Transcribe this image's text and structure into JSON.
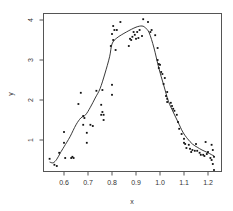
{
  "chart_data": {
    "type": "scatter",
    "title": "",
    "xlabel": "x",
    "ylabel": "y",
    "xlim": [
      0.53,
      1.25
    ],
    "ylim": [
      0.3,
      4.2
    ],
    "grid": false,
    "legend": null,
    "x_ticks": [
      0.6,
      0.7,
      0.8,
      0.9,
      1.0,
      1.1,
      1.2
    ],
    "x_tick_labels": [
      "0.6",
      "0.7",
      "0.8",
      "0.9",
      "1.0",
      "1.1",
      "1.2"
    ],
    "y_ticks": [
      1,
      2,
      3,
      4
    ],
    "y_tick_labels": [
      "1",
      "2",
      "3",
      "4"
    ],
    "series": [
      {
        "name": "observations",
        "type": "scatter",
        "points": [
          [
            0.54,
            0.53
          ],
          [
            0.56,
            0.38
          ],
          [
            0.57,
            0.35
          ],
          [
            0.58,
            0.68
          ],
          [
            0.6,
            0.93
          ],
          [
            0.6,
            1.2
          ],
          [
            0.605,
            0.55
          ],
          [
            0.63,
            0.55
          ],
          [
            0.635,
            0.58
          ],
          [
            0.64,
            0.55
          ],
          [
            0.66,
            1.9
          ],
          [
            0.67,
            2.18
          ],
          [
            0.68,
            1.6
          ],
          [
            0.685,
            1.55
          ],
          [
            0.68,
            1.38
          ],
          [
            0.695,
            1.18
          ],
          [
            0.695,
            0.93
          ],
          [
            0.71,
            1.38
          ],
          [
            0.72,
            1.35
          ],
          [
            0.735,
            2.23
          ],
          [
            0.755,
            1.63
          ],
          [
            0.755,
            1.88
          ],
          [
            0.76,
            1.7
          ],
          [
            0.765,
            1.5
          ],
          [
            0.765,
            1.63
          ],
          [
            0.76,
            2.25
          ],
          [
            0.8,
            2.13
          ],
          [
            0.8,
            2.38
          ],
          [
            0.795,
            3.35
          ],
          [
            0.8,
            3.65
          ],
          [
            0.805,
            3.5
          ],
          [
            0.81,
            3.75
          ],
          [
            0.805,
            3.85
          ],
          [
            0.815,
            3.25
          ],
          [
            0.82,
            3.75
          ],
          [
            0.835,
            3.95
          ],
          [
            0.87,
            3.35
          ],
          [
            0.875,
            3.53
          ],
          [
            0.88,
            3.5
          ],
          [
            0.885,
            3.58
          ],
          [
            0.89,
            3.7
          ],
          [
            0.895,
            3.63
          ],
          [
            0.9,
            3.53
          ],
          [
            0.905,
            3.7
          ],
          [
            0.91,
            3.55
          ],
          [
            0.915,
            3.75
          ],
          [
            0.925,
            3.6
          ],
          [
            0.93,
            4.02
          ],
          [
            0.95,
            3.95
          ],
          [
            0.96,
            3.7
          ],
          [
            0.965,
            3.75
          ],
          [
            0.98,
            3.62
          ],
          [
            0.99,
            3.3
          ],
          [
            0.99,
            3.0
          ],
          [
            0.995,
            2.9
          ],
          [
            0.995,
            2.8
          ],
          [
            1.0,
            2.88
          ],
          [
            1.005,
            2.7
          ],
          [
            1.01,
            2.65
          ],
          [
            1.015,
            2.4
          ],
          [
            1.02,
            2.55
          ],
          [
            1.025,
            2.1
          ],
          [
            1.03,
            2.2
          ],
          [
            1.03,
            2.03
          ],
          [
            1.03,
            1.95
          ],
          [
            1.045,
            1.93
          ],
          [
            1.05,
            1.85
          ],
          [
            1.055,
            1.78
          ],
          [
            1.06,
            1.73
          ],
          [
            1.07,
            1.63
          ],
          [
            1.075,
            1.45
          ],
          [
            1.08,
            1.28
          ],
          [
            1.09,
            1.15
          ],
          [
            1.1,
            1.03
          ],
          [
            1.1,
            0.93
          ],
          [
            1.105,
            0.9
          ],
          [
            1.11,
            0.8
          ],
          [
            1.12,
            0.88
          ],
          [
            1.125,
            0.78
          ],
          [
            1.13,
            0.7
          ],
          [
            1.135,
            0.75
          ],
          [
            1.145,
            0.73
          ],
          [
            1.15,
            0.9
          ],
          [
            1.155,
            0.73
          ],
          [
            1.165,
            0.68
          ],
          [
            1.17,
            0.63
          ],
          [
            1.18,
            0.63
          ],
          [
            1.185,
            0.6
          ],
          [
            1.19,
            0.95
          ],
          [
            1.195,
            0.65
          ],
          [
            1.2,
            0.7
          ],
          [
            1.21,
            0.55
          ],
          [
            1.215,
            0.5
          ],
          [
            1.215,
            0.88
          ],
          [
            1.22,
            0.75
          ],
          [
            1.22,
            0.4
          ],
          [
            1.225,
            0.58
          ],
          [
            1.225,
            0.25
          ]
        ]
      },
      {
        "name": "smooth fit",
        "type": "line",
        "x": [
          0.54,
          0.555,
          0.57,
          0.585,
          0.6,
          0.625,
          0.65,
          0.67,
          0.69,
          0.71,
          0.73,
          0.75,
          0.77,
          0.79,
          0.8,
          0.82,
          0.86,
          0.9,
          0.925,
          0.94,
          0.955,
          0.975,
          0.995,
          1.015,
          1.035,
          1.055,
          1.075,
          1.095,
          1.115,
          1.135,
          1.155,
          1.175,
          1.2,
          1.225
        ],
        "y": [
          0.45,
          0.43,
          0.52,
          0.68,
          0.83,
          1.08,
          1.38,
          1.55,
          1.63,
          1.82,
          2.05,
          2.28,
          2.65,
          3.08,
          3.4,
          3.55,
          3.7,
          3.82,
          3.85,
          3.8,
          3.68,
          3.3,
          2.8,
          2.38,
          1.97,
          1.7,
          1.45,
          1.2,
          1.03,
          0.9,
          0.82,
          0.75,
          0.68,
          0.6
        ]
      }
    ]
  }
}
